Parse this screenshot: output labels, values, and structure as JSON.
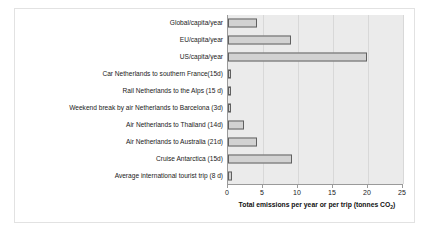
{
  "chart_data": {
    "type": "bar",
    "orientation": "horizontal",
    "title": "",
    "xlabel": "Total emissions per year or per trip (tonnes CO2)",
    "xlabel_prefix": "Total emissions per year or per trip (tonnes CO",
    "xlabel_sub": "2",
    "xlabel_suffix": ")",
    "ylabel": "",
    "xlim": [
      0,
      25
    ],
    "xticks": [
      0,
      5,
      10,
      15,
      20,
      25
    ],
    "xtick_labels": [
      "0",
      "5",
      "10",
      "15",
      "20",
      "25"
    ],
    "grid": true,
    "grid_axis": "x",
    "legend": false,
    "categories": [
      "Global/capita/year",
      "EU/capita/year",
      "US/capita/year",
      "Car Netherlands to southern France(15d)",
      "Rail Netherlands to the Alps (15 d)",
      "Weekend break by air Netherlands to Barcelona (3d)",
      "Air Netherlands to Thailand (14d)",
      "Air Netherlands to Australia (21d)",
      "Cruise Antarctica (15d)",
      "Average international tourist trip (8 d)"
    ],
    "values": [
      4.2,
      9.0,
      19.9,
      0.4,
      0.4,
      0.4,
      2.3,
      4.2,
      9.2,
      0.6
    ],
    "units": "tonnes CO2",
    "colors": {
      "bar_fill": "#d2d2d2",
      "bar_edge": "#606060",
      "plot_background": "#ebebeb",
      "gridline": "#d8d8d8",
      "axis_line": "#9a9a9a",
      "text": "#1a1a1a",
      "frame": "#e2e2e2",
      "page_background": "#ffffff"
    }
  }
}
